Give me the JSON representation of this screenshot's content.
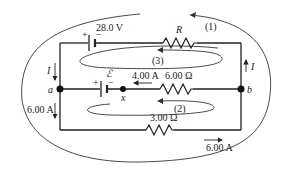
{
  "circuit": {
    "battery_top": {
      "voltage": "28.0 V",
      "plus": "+",
      "minus": "−"
    },
    "battery_emf": {
      "label": "ℰ",
      "plus": "+",
      "minus": "−"
    },
    "resistor_R": {
      "label": "R"
    },
    "resistor_mid": {
      "label": "6.00 Ω"
    },
    "resistor_bottom": {
      "label": "3.00 Ω"
    },
    "current_mid": {
      "label": "4.00 A"
    },
    "current_left_top": {
      "label": "I"
    },
    "current_right": {
      "label": "I"
    },
    "current_left_bottom": {
      "label": "6.00 A"
    },
    "current_bottom": {
      "label": "6.00 A"
    },
    "node_a": {
      "label": "a"
    },
    "node_b": {
      "label": "b"
    },
    "point_x": {
      "label": "x"
    },
    "loop1": {
      "label": "(1)"
    },
    "loop2": {
      "label": "(2)"
    },
    "loop3": {
      "label": "(3)"
    }
  }
}
